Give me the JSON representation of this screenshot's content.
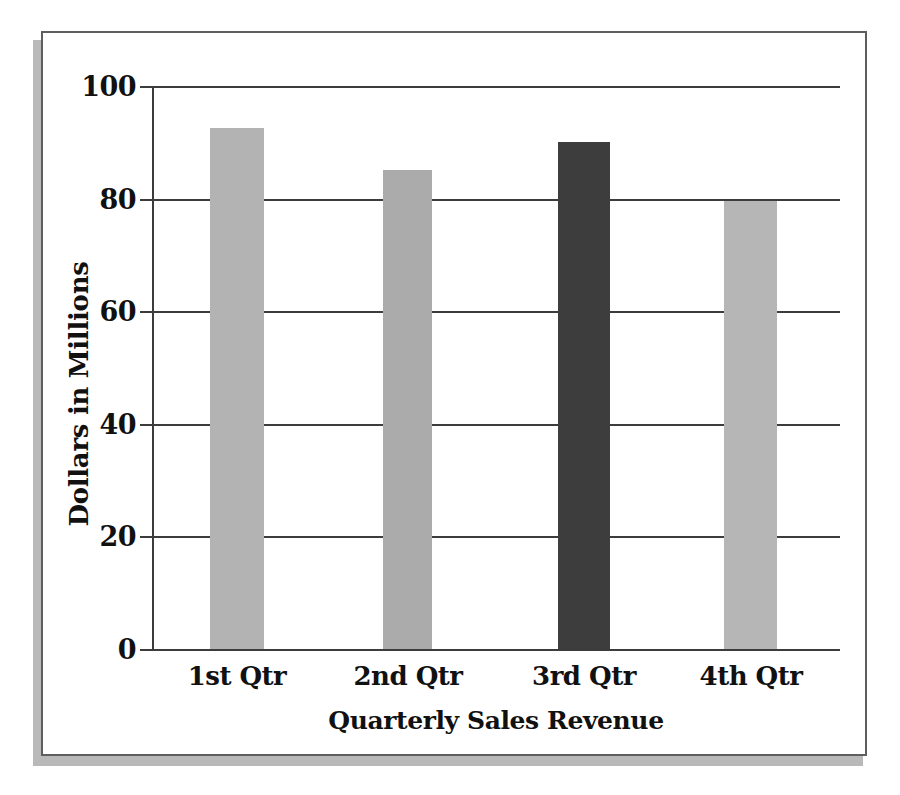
{
  "figure": {
    "frame_border_color": "#5e5e5e",
    "frame_shadow_color": "#b9b9b9",
    "background_color": "#ffffff"
  },
  "chart_data": {
    "type": "bar",
    "title": "",
    "xlabel": "Quarterly Sales Revenue",
    "ylabel": "Dollars in Millions",
    "categories": [
      "1st Qtr",
      "2nd Qtr",
      "3rd Qtr",
      "4th Qtr"
    ],
    "values": [
      92.5,
      85,
      90,
      79.5
    ],
    "bar_colors": [
      "#b3b3b3",
      "#ababab",
      "#3d3d3d",
      "#b6b6b6"
    ],
    "ylim": [
      0,
      100
    ],
    "yticks": [
      0,
      20,
      40,
      60,
      80,
      100
    ],
    "ytick_labels": [
      "0",
      "20",
      "40",
      "60",
      "80",
      "100"
    ],
    "grid": true,
    "legend": "none",
    "axis_color": "#3c3c3c"
  }
}
